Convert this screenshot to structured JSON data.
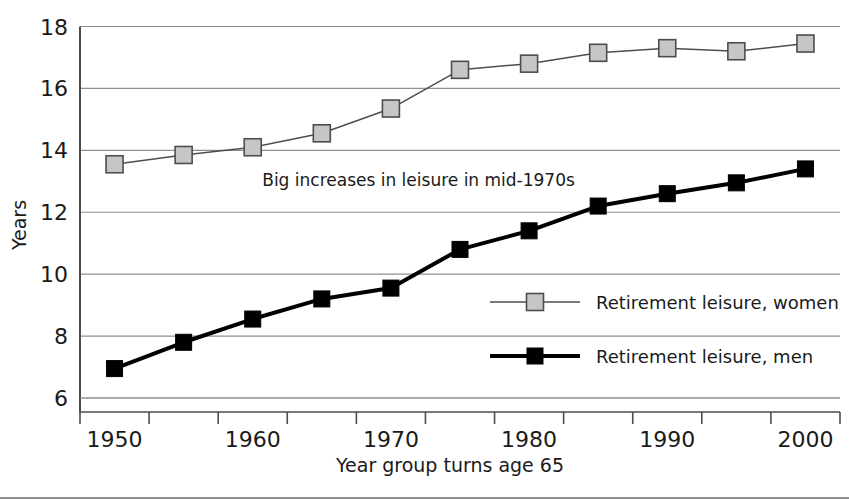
{
  "chart_data": {
    "type": "line",
    "title": "",
    "xlabel": "Year group turns age 65",
    "ylabel": "Years",
    "x": [
      1950,
      1955,
      1960,
      1965,
      1970,
      1975,
      1980,
      1985,
      1990,
      1995,
      2000
    ],
    "xtick_labels": [
      "1950",
      "1960",
      "1970",
      "1980",
      "1990",
      "2000"
    ],
    "xtick_values": [
      1950,
      1960,
      1970,
      1980,
      1990,
      2000
    ],
    "ytick_labels": [
      "6",
      "8",
      "10",
      "12",
      "14",
      "16",
      "18"
    ],
    "ytick_values": [
      6,
      8,
      10,
      12,
      14,
      16,
      18
    ],
    "ylim": [
      6,
      18
    ],
    "xlim": [
      1947.5,
      2002.5
    ],
    "grid": true,
    "grid_axis": "y",
    "legend_position": "inside-lower-right",
    "series": [
      {
        "name": "Retirement leisure, women",
        "color": "#c6c6c6",
        "line_color": "#4d4d4d",
        "line_width": 1.5,
        "marker": "square",
        "values": [
          13.55,
          13.85,
          14.1,
          14.55,
          15.35,
          16.6,
          16.8,
          17.15,
          17.3,
          17.2,
          17.45
        ]
      },
      {
        "name": "Retirement leisure, men",
        "color": "#000000",
        "line_color": "#000000",
        "line_width": 4,
        "marker": "square",
        "values": [
          6.95,
          7.8,
          8.55,
          9.2,
          9.55,
          10.8,
          11.4,
          12.2,
          12.6,
          12.95,
          13.4
        ]
      }
    ],
    "annotations": [
      {
        "text": "Big increases in leisure in mid-1970s",
        "x": 1972,
        "y": 12.85
      }
    ]
  },
  "legend": {
    "items": [
      {
        "label": "Retirement leisure, women"
      },
      {
        "label": "Retirement leisure, men"
      }
    ]
  },
  "axes": {
    "y_title": "Years",
    "x_title": "Year group turns age 65"
  },
  "colors": {
    "women_fill": "#c6c6c6",
    "women_edge": "#4d4d4d",
    "men_fill": "#000000",
    "grid": "#8f8f8f",
    "axis": "#4d4d4d",
    "text": "#1a1a1a",
    "background": "#ffffff"
  }
}
